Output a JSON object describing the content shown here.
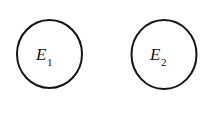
{
  "figure": {
    "type": "venn-style-set-diagram",
    "background_color": "#ffffff",
    "stroke_color": "#141414",
    "stroke_width": 2,
    "width": 217,
    "height": 125,
    "shapes": [
      {
        "name": "circle-e1",
        "shape": "ellipse",
        "cx": 49.5,
        "cy": 54,
        "rx": 32.5,
        "ry": 34
      },
      {
        "name": "circle-e2",
        "shape": "ellipse",
        "cx": 164,
        "cy": 54.5,
        "rx": 32.5,
        "ry": 34.5
      }
    ],
    "labels": [
      {
        "name": "label-e1",
        "base": "E",
        "subscript": "1",
        "text": "E1",
        "x": 36,
        "y": 46
      },
      {
        "name": "label-e2",
        "base": "E",
        "subscript": "2",
        "text": "E2",
        "x": 150,
        "y": 46
      }
    ]
  }
}
